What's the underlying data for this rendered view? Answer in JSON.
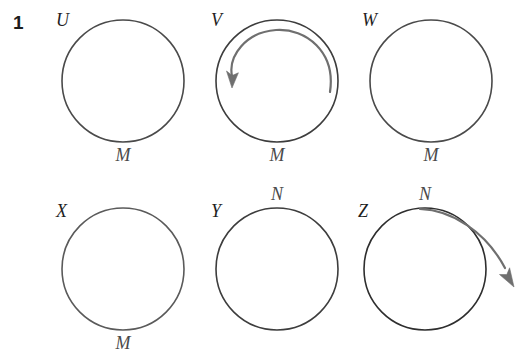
{
  "figure": {
    "question_number": "1",
    "width": 527,
    "height": 354,
    "background_color": "#ffffff",
    "circle_stroke_color": "#4a4a4a",
    "arrow_color": "#6b6b6b",
    "label_color": "#1f1f1f"
  },
  "panels": [
    {
      "id": "U",
      "label": "U",
      "label_x": 56,
      "label_y": 11,
      "circle": {
        "cx": 123,
        "cy": 81,
        "r": 61
      },
      "point_label": "M",
      "point_label_x": 123,
      "point_label_y": 146,
      "arrow": "none"
    },
    {
      "id": "V",
      "label": "V",
      "label_x": 211,
      "label_y": 11,
      "circle": {
        "cx": 277,
        "cy": 81,
        "r": 61
      },
      "point_label": "M",
      "point_label_x": 277,
      "point_label_y": 146,
      "arrow": "inward-spiral-top-right-to-center"
    },
    {
      "id": "W",
      "label": "W",
      "label_x": 362,
      "label_y": 11,
      "circle": {
        "cx": 431,
        "cy": 81,
        "r": 61
      },
      "point_label": "M",
      "point_label_x": 431,
      "point_label_y": 146,
      "arrow": "none"
    },
    {
      "id": "X",
      "label": "X",
      "label_x": 56,
      "label_y": 202,
      "circle": {
        "cx": 123,
        "cy": 269,
        "r": 61
      },
      "point_label": "M",
      "point_label_x": 123,
      "point_label_y": 334,
      "arrow": "none"
    },
    {
      "id": "Y",
      "label": "Y",
      "label_x": 211,
      "label_y": 202,
      "circle": {
        "cx": 277,
        "cy": 269,
        "r": 61
      },
      "point_label": "N",
      "point_label_x": 277,
      "point_label_y": 185,
      "arrow": "none"
    },
    {
      "id": "Z",
      "label": "Z",
      "label_x": 358,
      "label_y": 202,
      "circle": {
        "cx": 425,
        "cy": 269,
        "r": 61
      },
      "point_label": "N",
      "point_label_x": 425,
      "point_label_y": 185,
      "arrow": "outward-from-top-to-lower-right"
    }
  ]
}
